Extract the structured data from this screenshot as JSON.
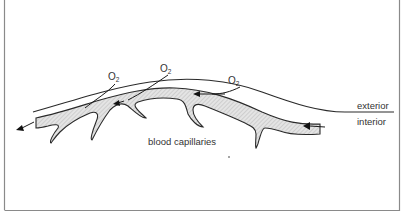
{
  "diagram": {
    "labels": {
      "exterior": "exterior",
      "interior": "interior",
      "capillaries": "blood capillaries"
    },
    "oxygen_labels": [
      {
        "symbol": "O",
        "subscript": "2"
      },
      {
        "symbol": "O",
        "subscript": "2"
      },
      {
        "symbol": "O",
        "subscript": "2"
      }
    ],
    "colors": {
      "line": "#2a2a2a",
      "vessel_fill": "#d9d9d9",
      "frame": "#8a8a8a",
      "text": "#333333"
    }
  }
}
